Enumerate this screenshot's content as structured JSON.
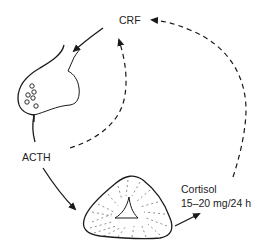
{
  "diagram": {
    "type": "hormonal feedback loop",
    "labels": {
      "crf": "CRF",
      "acth": "ACTH",
      "cortisol": "Cortisol",
      "cortisol_rate": "15–20 mg/24 h"
    },
    "nodes": [
      {
        "id": "hypothalamus-signal",
        "label": "CRF"
      },
      {
        "id": "pituitary",
        "label": ""
      },
      {
        "id": "acth-signal",
        "label": "ACTH"
      },
      {
        "id": "adrenal-gland",
        "label": ""
      },
      {
        "id": "cortisol-output",
        "label": "Cortisol 15–20 mg/24 h"
      }
    ],
    "edges": [
      {
        "from": "CRF",
        "to": "pituitary",
        "style": "solid"
      },
      {
        "from": "pituitary",
        "to": "ACTH",
        "style": "solid"
      },
      {
        "from": "ACTH",
        "to": "adrenal-gland",
        "style": "solid"
      },
      {
        "from": "adrenal-gland",
        "to": "Cortisol",
        "style": "solid"
      },
      {
        "from": "Cortisol",
        "to": "CRF",
        "style": "dashed"
      },
      {
        "from": "ACTH region",
        "to": "pituitary",
        "style": "dashed"
      }
    ],
    "colors": {
      "line": "#1a1a1a",
      "text": "#222222",
      "background": "#ffffff"
    }
  }
}
